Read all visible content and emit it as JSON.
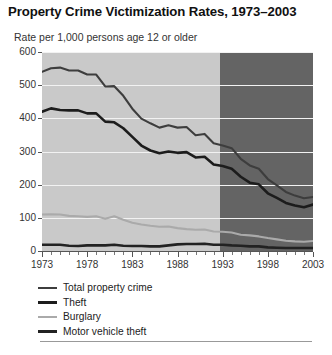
{
  "title": "Property Crime Victimization Rates, 1973–2003",
  "subtitle": "Rate per 1,000 persons age 12 or older",
  "legend": {
    "items": [
      {
        "label": "Total property crime",
        "color": "#3d3d3d",
        "width": "2px"
      },
      {
        "label": "Theft",
        "color": "#1c1c1c",
        "width": "3px"
      },
      {
        "label": "Burglary",
        "color": "#aaaaaa",
        "width": "2px"
      },
      {
        "label": "Motor vehicle theft",
        "color": "#222222",
        "width": "3px"
      }
    ]
  },
  "axes": {
    "y_ticks": [
      "600",
      "500",
      "400",
      "300",
      "200",
      "100",
      "0"
    ],
    "x_labels": [
      "1973",
      "1978",
      "1983",
      "1988",
      "1993",
      "1998",
      "2003"
    ]
  },
  "colors": {
    "plot_background": "#c9c9c9",
    "shaded_region": "#646464",
    "gridline": "#f2f2f2",
    "axis": "#555555"
  },
  "chart_data": {
    "type": "line",
    "title": "Property Crime Victimization Rates, 1973–2003",
    "xlabel": "",
    "ylabel": "Rate per 1,000 persons age 12 or older",
    "xlim": [
      1973,
      2003
    ],
    "ylim": [
      0,
      600
    ],
    "yticks": [
      0,
      100,
      200,
      300,
      400,
      500,
      600
    ],
    "grid": "horizontal",
    "legend_position": "below-left",
    "shaded_x_range": [
      1993,
      2003
    ],
    "x": [
      1973,
      1974,
      1975,
      1976,
      1977,
      1978,
      1979,
      1980,
      1981,
      1982,
      1983,
      1984,
      1985,
      1986,
      1987,
      1988,
      1989,
      1990,
      1991,
      1992,
      1993,
      1994,
      1995,
      1996,
      1997,
      1998,
      1999,
      2000,
      2001,
      2002,
      2003
    ],
    "series": [
      {
        "name": "Total property crime",
        "color": "#3d3d3d",
        "values": [
          540,
          551,
          553,
          544,
          544,
          532,
          532,
          496,
          497,
          468,
          429,
          399,
          385,
          372,
          379,
          372,
          374,
          349,
          353,
          325,
          318,
          310,
          278,
          258,
          248,
          217,
          198,
          178,
          167,
          159,
          163
        ]
      },
      {
        "name": "Theft",
        "color": "#1c1c1c",
        "values": [
          420,
          430,
          425,
          424,
          424,
          415,
          415,
          390,
          388,
          370,
          344,
          318,
          303,
          295,
          300,
          296,
          298,
          282,
          284,
          261,
          256,
          248,
          224,
          206,
          201,
          174,
          160,
          145,
          137,
          132,
          140
        ]
      },
      {
        "name": "Burglary",
        "color": "#aaaaaa",
        "values": [
          110,
          111,
          110,
          106,
          105,
          103,
          105,
          97,
          105,
          94,
          85,
          80,
          76,
          73,
          74,
          69,
          66,
          64,
          65,
          59,
          58,
          56,
          49,
          47,
          44,
          39,
          35,
          31,
          29,
          28,
          30
        ]
      },
      {
        "name": "Motor vehicle theft",
        "color": "#222222",
        "values": [
          19,
          19,
          19,
          16,
          15,
          17,
          17,
          17,
          19,
          16,
          15,
          15,
          14,
          14,
          17,
          20,
          21,
          21,
          22,
          19,
          19,
          17,
          16,
          14,
          14,
          11,
          10,
          9,
          9,
          9,
          9
        ]
      }
    ]
  }
}
